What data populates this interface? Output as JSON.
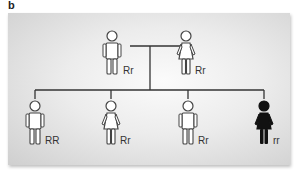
{
  "figure": {
    "panel_label": "b",
    "background": "#e8e8e8",
    "line_color": "#333333",
    "generation_1": [
      {
        "sex": "male",
        "affected": false,
        "genotype": "Rr"
      },
      {
        "sex": "female",
        "affected": false,
        "genotype": "Rr"
      }
    ],
    "generation_2": [
      {
        "sex": "male",
        "affected": false,
        "genotype": "RR"
      },
      {
        "sex": "female",
        "affected": false,
        "genotype": "Rr"
      },
      {
        "sex": "male",
        "affected": false,
        "genotype": "Rr"
      },
      {
        "sex": "female",
        "affected": true,
        "genotype": "rr"
      }
    ]
  }
}
